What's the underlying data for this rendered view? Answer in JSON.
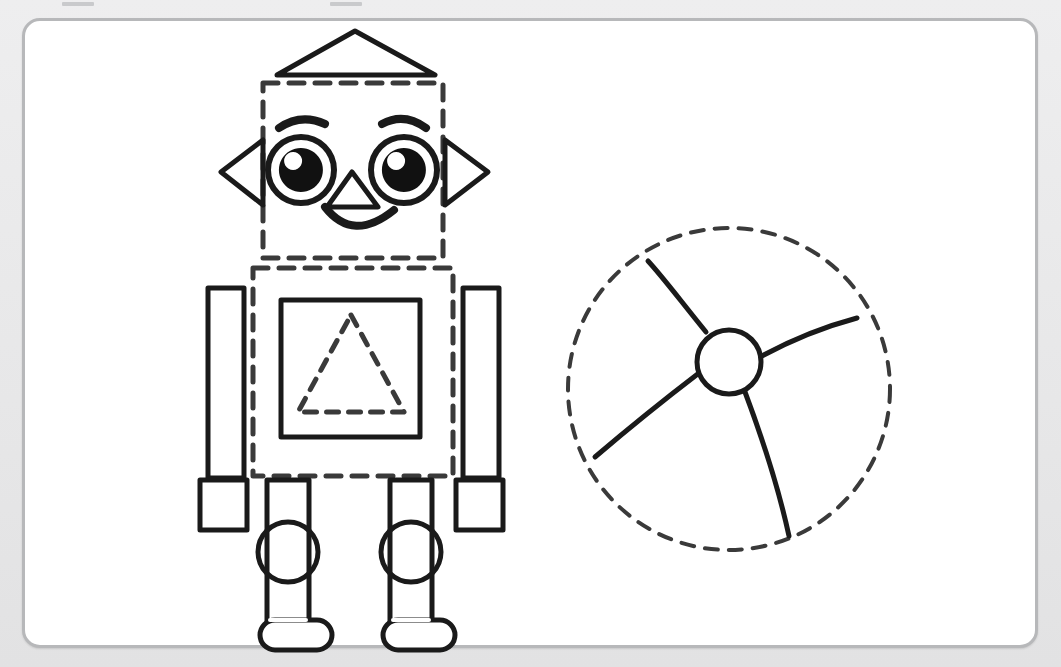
{
  "page": {
    "background_color": "#e9e9ea",
    "card_color": "#ffffff",
    "card_border_color": "#b7b8ba",
    "ink_color": "#1a1a1a",
    "dash_color": "#3a3a3a"
  },
  "binder_marks": [
    {
      "left": 62,
      "width": 32
    },
    {
      "left": 330,
      "width": 32
    }
  ],
  "figures": [
    {
      "name": "robot",
      "label": "Robot made of shapes",
      "parts": [
        {
          "name": "hat",
          "shape": "triangle",
          "style": "solid",
          "points": "355,31 435,75 277,75",
          "stroke_width": 5
        },
        {
          "name": "head",
          "shape": "square",
          "style": "dashed",
          "x": 263,
          "y": 83,
          "width": 180,
          "height": 175,
          "stroke_width": 5
        },
        {
          "name": "left-ear",
          "shape": "triangle",
          "style": "solid",
          "points": "221,172 263,140 263,205",
          "stroke_width": 5
        },
        {
          "name": "right-ear",
          "shape": "triangle",
          "style": "solid",
          "points": "488,172 445,140 445,205",
          "stroke_width": 5
        },
        {
          "name": "left-eye",
          "shape": "circle",
          "style": "solid",
          "cx": 301,
          "cy": 170,
          "r": 33,
          "stroke_width": 6
        },
        {
          "name": "right-eye",
          "shape": "circle",
          "style": "solid",
          "cx": 404,
          "cy": 170,
          "r": 33,
          "stroke_width": 6
        },
        {
          "name": "nose",
          "shape": "triangle",
          "style": "solid",
          "points": "352,172 378,207 327,207",
          "stroke_width": 5
        },
        {
          "name": "mouth",
          "shape": "arc",
          "style": "solid",
          "stroke_width": 7
        },
        {
          "name": "body",
          "shape": "rectangle",
          "style": "dashed",
          "x": 253,
          "y": 268,
          "width": 200,
          "height": 208,
          "stroke_width": 5
        },
        {
          "name": "chest-square",
          "shape": "square",
          "style": "solid",
          "x": 281,
          "y": 300,
          "width": 139,
          "height": 137,
          "stroke_width": 5
        },
        {
          "name": "chest-triangle",
          "shape": "triangle",
          "style": "dashed",
          "points": "351,315 404,412 298,412",
          "stroke_width": 5
        },
        {
          "name": "left-arm",
          "shape": "rectangle",
          "style": "solid",
          "x": 208,
          "y": 288,
          "width": 36,
          "height": 190,
          "stroke_width": 5
        },
        {
          "name": "right-arm",
          "shape": "rectangle",
          "style": "solid",
          "x": 463,
          "y": 288,
          "width": 36,
          "height": 190,
          "stroke_width": 5
        },
        {
          "name": "left-hand",
          "shape": "square",
          "style": "solid",
          "x": 200,
          "y": 480,
          "width": 47,
          "height": 50,
          "stroke_width": 5
        },
        {
          "name": "right-hand",
          "shape": "square",
          "style": "solid",
          "x": 456,
          "y": 480,
          "width": 47,
          "height": 50,
          "stroke_width": 5
        },
        {
          "name": "left-leg",
          "shape": "rectangle",
          "style": "solid",
          "x": 267,
          "y": 480,
          "width": 42,
          "height": 150,
          "stroke_width": 5
        },
        {
          "name": "right-leg",
          "shape": "rectangle",
          "style": "solid",
          "x": 390,
          "y": 480,
          "width": 42,
          "height": 150,
          "stroke_width": 5
        },
        {
          "name": "left-knee",
          "shape": "circle",
          "style": "solid",
          "cx": 288,
          "cy": 552,
          "r": 30,
          "stroke_width": 5
        },
        {
          "name": "right-knee",
          "shape": "circle",
          "style": "solid",
          "cx": 411,
          "cy": 552,
          "r": 30,
          "stroke_width": 5
        },
        {
          "name": "left-foot",
          "shape": "rounded-rectangle",
          "style": "solid",
          "x": 260,
          "y": 620,
          "width": 72,
          "height": 30,
          "radius": 15,
          "stroke_width": 5
        },
        {
          "name": "right-foot",
          "shape": "rounded-rectangle",
          "style": "solid",
          "x": 383,
          "y": 620,
          "width": 72,
          "height": 30,
          "radius": 15,
          "stroke_width": 5
        }
      ]
    },
    {
      "name": "beach-ball",
      "label": "Beach ball made of a circle",
      "parts": [
        {
          "name": "ball-outline",
          "shape": "circle",
          "style": "dashed",
          "cx": 729,
          "cy": 389,
          "r": 161,
          "stroke_width": 4
        },
        {
          "name": "ball-hub",
          "shape": "circle",
          "style": "solid",
          "cx": 729,
          "cy": 362,
          "r": 32,
          "stroke_width": 5
        },
        {
          "name": "ball-seam-upper-left",
          "shape": "curve",
          "style": "solid",
          "path": "M 704,333 C 678,302 660,276 648,262",
          "stroke_width": 5
        },
        {
          "name": "ball-seam-right",
          "shape": "curve",
          "style": "solid",
          "path": "M 760,358 C 792,340 826,326 857,318",
          "stroke_width": 5
        },
        {
          "name": "ball-seam-lower-left",
          "shape": "curve",
          "style": "solid",
          "path": "M 698,372 C 664,398 628,428 595,456",
          "stroke_width": 5
        },
        {
          "name": "ball-seam-bottom",
          "shape": "curve",
          "style": "solid",
          "path": "M 744,393 C 762,440 778,490 789,535",
          "stroke_width": 5
        }
      ]
    }
  ]
}
